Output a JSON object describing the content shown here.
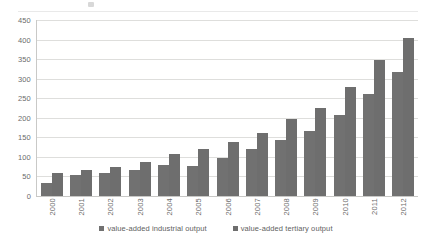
{
  "chart_data": {
    "type": "bar",
    "title": "",
    "subtitle": "",
    "xlabel": "",
    "ylabel": "",
    "ylim": [
      0,
      450
    ],
    "ytick_step": 50,
    "yticks": [
      0,
      50,
      100,
      150,
      200,
      250,
      300,
      350,
      400,
      450
    ],
    "grid": true,
    "legend_position": "bottom",
    "orientation": "vertical",
    "categories": [
      "2000",
      "2001",
      "2002",
      "2003",
      "2004",
      "2005",
      "2006",
      "2007",
      "2008",
      "2009",
      "2010",
      "2011",
      "2012"
    ],
    "series": [
      {
        "name": "value-added industrial output",
        "color": "#717171",
        "values": [
          33,
          54,
          58,
          67,
          79,
          78,
          97,
          119,
          142,
          167,
          207,
          261,
          318
        ]
      },
      {
        "name": "value-added tertiary output",
        "color": "#6e6e6e",
        "values": [
          60,
          66,
          75,
          88,
          107,
          119,
          139,
          160,
          198,
          225,
          278,
          348,
          403
        ]
      }
    ]
  },
  "legend": {
    "items": [
      {
        "label": "value-added industrial output",
        "marker": "square-marker"
      },
      {
        "label": "value-added tertiary output",
        "marker": "square-marker"
      }
    ]
  },
  "axes": {
    "y": {
      "tick_labels": [
        "450",
        "400",
        "350",
        "300",
        "250",
        "200",
        "150",
        "100",
        "50",
        "0"
      ]
    },
    "x": {
      "tick_labels": [
        "2000",
        "2001",
        "2002",
        "2003",
        "2004",
        "2005",
        "2006",
        "2007",
        "2008",
        "2009",
        "2010",
        "2011",
        "2012"
      ]
    }
  }
}
